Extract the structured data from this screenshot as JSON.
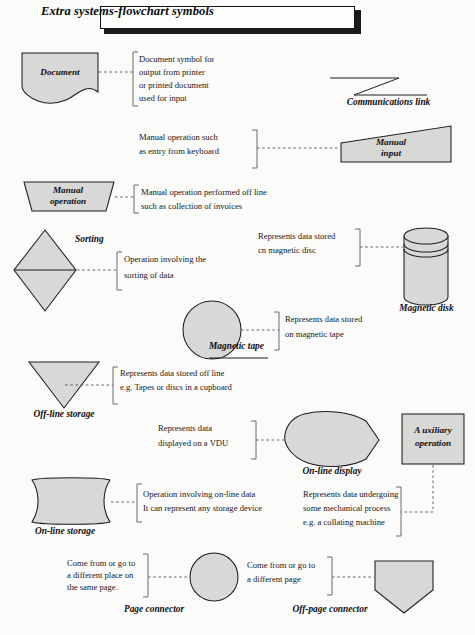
{
  "title": "Extra systems-flowchart symbols",
  "page": {
    "width": 475,
    "height": 635,
    "background": "#fbfbf9"
  },
  "colors": {
    "shape_fill": "#d8d8d6",
    "shape_stroke": "#1d1d1f",
    "text": "#17161a",
    "title_shadow": "#1a1a1a",
    "leader_line": "#56555a"
  },
  "symbols": [
    {
      "id": "document",
      "label": "Document",
      "label_position": "inside",
      "description_lines": [
        "Document symbol for",
        "output from printer",
        "or printed document",
        "used for input"
      ]
    },
    {
      "id": "communications-link",
      "label": "Communications link",
      "label_position": "below",
      "description_lines": []
    },
    {
      "id": "manual-input",
      "label": "Manual\ninput",
      "label_line1": "Manual",
      "label_line2": "input",
      "label_position": "inside",
      "description_lines": [
        "Manual operation such",
        "as entry from keyboard"
      ]
    },
    {
      "id": "manual-operation",
      "label": "Manual\noperation",
      "label_line1": "Manual",
      "label_line2": "operation",
      "label_position": "inside",
      "description_lines": [
        "Manual operation performed off line",
        "such as collection of invoices"
      ]
    },
    {
      "id": "sorting",
      "label": "Sorting",
      "label_position": "right",
      "description_lines": [
        "Operation involving the",
        "sorting of data"
      ]
    },
    {
      "id": "magnetic-disk",
      "label": "Magnetic disk",
      "label_position": "below",
      "description_lines": [
        "Represents data stored",
        "cn magnetic disc"
      ]
    },
    {
      "id": "magnetic-tape",
      "label": "Magnetic tape",
      "label_position": "right",
      "description_lines": [
        "Represents data stored",
        "on magnetic tape"
      ]
    },
    {
      "id": "off-line-storage",
      "label": "Off-line storage",
      "label_position": "below",
      "description_lines": [
        "Represents data stored off line",
        "e.g. Tapes or discs in a cupboard"
      ]
    },
    {
      "id": "on-line-display",
      "label": "On-line display",
      "label_position": "below",
      "description_lines": [
        "Represents data",
        "displayed on a VDU"
      ]
    },
    {
      "id": "auxiliary-operation",
      "label": "Auxiliary\noperation",
      "label_line1": "A uxiliary",
      "label_line2": "operation",
      "label_position": "inside",
      "description_lines": [
        "Represents data undergoing",
        "some mechanical process",
        "e.g. a collating machine"
      ]
    },
    {
      "id": "on-line-storage",
      "label": "On-line storage",
      "label_position": "below",
      "description_lines": [
        "Operation involving on-line data",
        "It can represent any storage device"
      ]
    },
    {
      "id": "page-connector",
      "label": "Page connector",
      "label_position": "below",
      "description_lines": [
        "Come from or go to",
        "a different place on",
        "the same page."
      ]
    },
    {
      "id": "off-page-connector",
      "label": "Off-page connector",
      "label_position": "below",
      "description_lines": [
        "Come from or go to",
        "a different page"
      ]
    }
  ],
  "annotations": {
    "document_l1": "Document symbol for",
    "document_l2": "output from printer",
    "document_l3": "or printed document",
    "document_l4": "used for input",
    "manual_input_l1": "Manual operation such",
    "manual_input_l2": "as entry from keyboard",
    "manual_operation_l1": "Manual operation performed off line",
    "manual_operation_l2": "such as collection of invoices",
    "sorting_l1": "Operation involving the",
    "sorting_l2": "sorting of data",
    "magnetic_disk_l1": "Represents data stored",
    "magnetic_disk_l2": "cn magnetic disc",
    "magnetic_tape_l1": "Represents data stored",
    "magnetic_tape_l2": "on magnetic tape",
    "off_line_storage_l1": "Represents data stored off line",
    "off_line_storage_l2": "e.g. Tapes or discs in a cupboard",
    "on_line_display_l1": "Represents data",
    "on_line_display_l2": "displayed on a VDU",
    "auxiliary_l1": "Represents data undergoing",
    "auxiliary_l2": "some mechanical process",
    "auxiliary_l3": "e.g. a collating machine",
    "on_line_storage_l1": "Operation involving on-line data",
    "on_line_storage_l2": "It can represent any storage device",
    "page_connector_l1": "Come from or go to",
    "page_connector_l2": "a different place on",
    "page_connector_l3": "the same page.",
    "off_page_connector_l1": "Come from or go to",
    "off_page_connector_l2": "a different page"
  },
  "shape_labels": {
    "document": "Document",
    "communications_link": "Communications link",
    "manual_input_1": "Manual",
    "manual_input_2": "input",
    "manual_operation_1": "Manual",
    "manual_operation_2": "operation",
    "sorting": "Sorting",
    "magnetic_disk": "Magnetic disk",
    "magnetic_tape": "Magnetic tape",
    "off_line_storage": "Off-line storage",
    "on_line_display": "On-line display",
    "auxiliary_1": "A uxiliary",
    "auxiliary_2": "operation",
    "on_line_storage": "On-line storage",
    "page_connector": "Page connector",
    "off_page_connector": "Off-page connector"
  }
}
